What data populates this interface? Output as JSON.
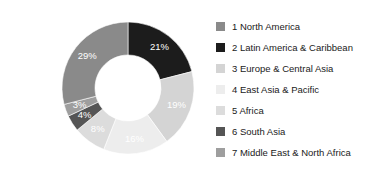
{
  "chart_data": {
    "type": "pie",
    "variant": "donut",
    "title": "",
    "subtitle": "",
    "xlabel": "",
    "ylabel": "",
    "start_angle_deg": 0,
    "direction": "clockwise",
    "inner_radius_ratio": 0.5,
    "grid": false,
    "legend_position": "right",
    "value_unit": "%",
    "categories": [
      "1 North America",
      "2 Latin America & Caribbean",
      "3 Europe & Central Asia",
      "4 East Asia & Pacific",
      "5 Africa",
      "6 South Asia",
      "7 Middle East & North Africa"
    ],
    "values": [
      29,
      21,
      19,
      16,
      8,
      4,
      3
    ],
    "data_labels": [
      "29%",
      "21%",
      "19%",
      "16%",
      "8%",
      "4%",
      "3%"
    ],
    "colors": [
      "#8a8a8a",
      "#1c1c1c",
      "#d4d4d4",
      "#ededed",
      "#dcdcdc",
      "#555555",
      "#9e9e9e"
    ],
    "slices": [
      {
        "index": 1,
        "name": "1 North America",
        "value": 29,
        "label": "29%",
        "color": "#8a8a8a",
        "swatch": "#8a8a8a",
        "draw_order": 6
      },
      {
        "index": 2,
        "name": "2 Latin America & Caribbean",
        "value": 21,
        "label": "21%",
        "color": "#1c1c1c",
        "swatch": "#1c1c1c",
        "draw_order": 0
      },
      {
        "index": 3,
        "name": "3 Europe & Central Asia",
        "value": 19,
        "label": "19%",
        "color": "#d4d4d4",
        "swatch": "#d4d4d4",
        "draw_order": 1
      },
      {
        "index": 4,
        "name": "4 East Asia & Pacific",
        "value": 16,
        "label": "16%",
        "color": "#ededed",
        "swatch": "#ededed",
        "draw_order": 2
      },
      {
        "index": 5,
        "name": "5 Africa",
        "value": 8,
        "label": "8%",
        "color": "#dcdcdc",
        "swatch": "#dcdcdc",
        "draw_order": 3
      },
      {
        "index": 6,
        "name": "6 South Asia",
        "value": 4,
        "label": "4%",
        "color": "#555555",
        "swatch": "#555555",
        "draw_order": 4
      },
      {
        "index": 7,
        "name": "7 Middle East & North Africa",
        "value": 3,
        "label": "3%",
        "color": "#9e9e9e",
        "swatch": "#9e9e9e",
        "draw_order": 5
      }
    ]
  },
  "legend": {
    "items": [
      {
        "label": "1 North America",
        "color": "#8a8a8a"
      },
      {
        "label": "2 Latin America & Caribbean",
        "color": "#1c1c1c"
      },
      {
        "label": "3 Europe & Central Asia",
        "color": "#d4d4d4"
      },
      {
        "label": "4 East Asia & Pacific",
        "color": "#ededed"
      },
      {
        "label": "5 Africa",
        "color": "#dcdcdc"
      },
      {
        "label": "6 South Asia",
        "color": "#555555"
      },
      {
        "label": "7 Middle East & North Africa",
        "color": "#9e9e9e"
      }
    ]
  }
}
